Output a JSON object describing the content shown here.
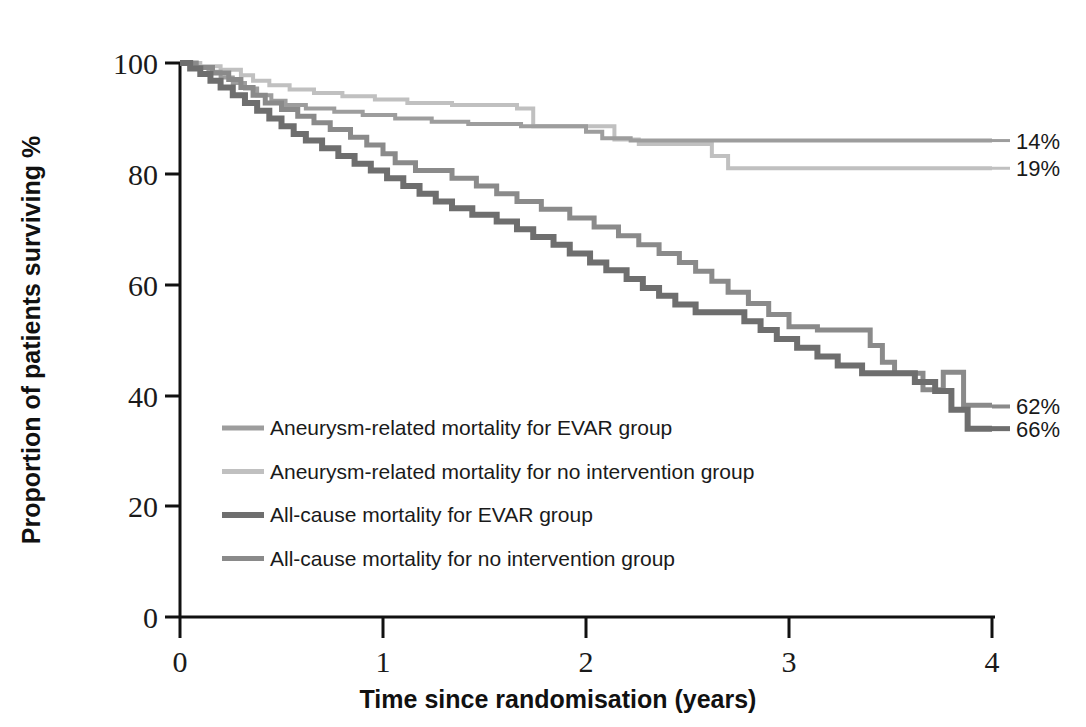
{
  "chart_data": {
    "type": "line",
    "title": "",
    "xlabel": "Time since randomisation (years)",
    "ylabel": "Proportion of patients surviving %",
    "xlim": [
      0,
      4
    ],
    "ylim": [
      0,
      100
    ],
    "xticks": [
      "0",
      "1",
      "2",
      "3",
      "4"
    ],
    "yticks": [
      "0",
      "20",
      "40",
      "60",
      "80",
      "100"
    ],
    "grid": false,
    "legend_position": "inside-lower-left",
    "series": [
      {
        "name": "Aneurysm-related mortality for EVAR group",
        "color": "#9d9d9d",
        "width": 4,
        "endpoint_label": "14%",
        "endpoint_value": 86,
        "points": [
          [
            0.0,
            100
          ],
          [
            0.07,
            100
          ],
          [
            0.07,
            99.2
          ],
          [
            0.14,
            99.2
          ],
          [
            0.14,
            98.4
          ],
          [
            0.2,
            98.4
          ],
          [
            0.2,
            97.4
          ],
          [
            0.26,
            97.4
          ],
          [
            0.26,
            96.4
          ],
          [
            0.32,
            96.4
          ],
          [
            0.32,
            95.4
          ],
          [
            0.38,
            95.4
          ],
          [
            0.38,
            94.2
          ],
          [
            0.45,
            94.2
          ],
          [
            0.45,
            93.2
          ],
          [
            0.52,
            93.2
          ],
          [
            0.52,
            92.4
          ],
          [
            0.62,
            92.4
          ],
          [
            0.62,
            91.8
          ],
          [
            0.76,
            91.8
          ],
          [
            0.76,
            91.2
          ],
          [
            0.9,
            91.2
          ],
          [
            0.9,
            90.6
          ],
          [
            1.06,
            90.6
          ],
          [
            1.06,
            90.0
          ],
          [
            1.24,
            90.0
          ],
          [
            1.24,
            89.4
          ],
          [
            1.42,
            89.4
          ],
          [
            1.42,
            89.0
          ],
          [
            1.68,
            89.0
          ],
          [
            1.68,
            88.6
          ],
          [
            2.0,
            88.6
          ],
          [
            2.0,
            87.6
          ],
          [
            2.08,
            87.6
          ],
          [
            2.08,
            86.4
          ],
          [
            2.22,
            86.4
          ],
          [
            2.22,
            86.0
          ],
          [
            4.0,
            86.0
          ]
        ]
      },
      {
        "name": "Aneurysm-related mortality for no intervention group",
        "color": "#c0c0c0",
        "width": 4,
        "endpoint_label": "19%",
        "endpoint_value": 81,
        "points": [
          [
            0.0,
            100
          ],
          [
            0.1,
            100
          ],
          [
            0.1,
            99.4
          ],
          [
            0.2,
            99.4
          ],
          [
            0.2,
            98.8
          ],
          [
            0.3,
            98.8
          ],
          [
            0.3,
            97.8
          ],
          [
            0.36,
            97.8
          ],
          [
            0.36,
            96.8
          ],
          [
            0.44,
            96.8
          ],
          [
            0.44,
            96.0
          ],
          [
            0.54,
            96.0
          ],
          [
            0.54,
            95.2
          ],
          [
            0.66,
            95.2
          ],
          [
            0.66,
            94.6
          ],
          [
            0.8,
            94.6
          ],
          [
            0.8,
            94.0
          ],
          [
            0.96,
            94.0
          ],
          [
            0.96,
            93.4
          ],
          [
            1.12,
            93.4
          ],
          [
            1.12,
            92.8
          ],
          [
            1.34,
            92.8
          ],
          [
            1.34,
            92.4
          ],
          [
            1.66,
            92.4
          ],
          [
            1.66,
            91.8
          ],
          [
            1.74,
            91.8
          ],
          [
            1.74,
            88.6
          ],
          [
            2.14,
            88.6
          ],
          [
            2.14,
            86.2
          ],
          [
            2.26,
            86.2
          ],
          [
            2.26,
            85.4
          ],
          [
            2.62,
            85.4
          ],
          [
            2.62,
            83.2
          ],
          [
            2.7,
            83.2
          ],
          [
            2.7,
            81.0
          ],
          [
            4.0,
            81.0
          ]
        ]
      },
      {
        "name": "All-cause mortality for EVAR group",
        "color": "#6e6e6e",
        "width": 6,
        "endpoint_label": "66%",
        "endpoint_value": 34,
        "points": [
          [
            0.0,
            100
          ],
          [
            0.05,
            100
          ],
          [
            0.05,
            99.0
          ],
          [
            0.1,
            99.0
          ],
          [
            0.1,
            98.0
          ],
          [
            0.15,
            98.0
          ],
          [
            0.15,
            96.8
          ],
          [
            0.2,
            96.8
          ],
          [
            0.2,
            95.6
          ],
          [
            0.26,
            95.6
          ],
          [
            0.26,
            94.2
          ],
          [
            0.32,
            94.2
          ],
          [
            0.32,
            92.8
          ],
          [
            0.38,
            92.8
          ],
          [
            0.38,
            91.4
          ],
          [
            0.44,
            91.4
          ],
          [
            0.44,
            90.0
          ],
          [
            0.5,
            90.0
          ],
          [
            0.5,
            88.6
          ],
          [
            0.56,
            88.6
          ],
          [
            0.56,
            87.2
          ],
          [
            0.62,
            87.2
          ],
          [
            0.62,
            86.0
          ],
          [
            0.7,
            86.0
          ],
          [
            0.7,
            84.6
          ],
          [
            0.78,
            84.6
          ],
          [
            0.78,
            83.2
          ],
          [
            0.86,
            83.2
          ],
          [
            0.86,
            81.8
          ],
          [
            0.94,
            81.8
          ],
          [
            0.94,
            80.6
          ],
          [
            1.02,
            80.6
          ],
          [
            1.02,
            79.2
          ],
          [
            1.1,
            79.2
          ],
          [
            1.1,
            77.8
          ],
          [
            1.18,
            77.8
          ],
          [
            1.18,
            76.4
          ],
          [
            1.26,
            76.4
          ],
          [
            1.26,
            75.0
          ],
          [
            1.34,
            75.0
          ],
          [
            1.34,
            73.8
          ],
          [
            1.44,
            73.8
          ],
          [
            1.44,
            72.6
          ],
          [
            1.56,
            72.6
          ],
          [
            1.56,
            71.4
          ],
          [
            1.66,
            71.4
          ],
          [
            1.66,
            70.0
          ],
          [
            1.74,
            70.0
          ],
          [
            1.74,
            68.6
          ],
          [
            1.84,
            68.6
          ],
          [
            1.84,
            67.2
          ],
          [
            1.92,
            67.2
          ],
          [
            1.92,
            65.6
          ],
          [
            2.02,
            65.6
          ],
          [
            2.02,
            64.0
          ],
          [
            2.1,
            64.0
          ],
          [
            2.1,
            62.6
          ],
          [
            2.2,
            62.6
          ],
          [
            2.2,
            61.0
          ],
          [
            2.28,
            61.0
          ],
          [
            2.28,
            59.4
          ],
          [
            2.36,
            59.4
          ],
          [
            2.36,
            58.0
          ],
          [
            2.44,
            58.0
          ],
          [
            2.44,
            56.4
          ],
          [
            2.54,
            56.4
          ],
          [
            2.54,
            55.0
          ],
          [
            2.78,
            55.0
          ],
          [
            2.78,
            53.4
          ],
          [
            2.86,
            53.4
          ],
          [
            2.86,
            51.8
          ],
          [
            2.94,
            51.8
          ],
          [
            2.94,
            50.2
          ],
          [
            3.04,
            50.2
          ],
          [
            3.04,
            48.6
          ],
          [
            3.14,
            48.6
          ],
          [
            3.14,
            47.0
          ],
          [
            3.24,
            47.0
          ],
          [
            3.24,
            45.4
          ],
          [
            3.36,
            45.4
          ],
          [
            3.36,
            44.0
          ],
          [
            3.62,
            44.0
          ],
          [
            3.62,
            42.4
          ],
          [
            3.72,
            42.4
          ],
          [
            3.72,
            40.8
          ],
          [
            3.8,
            40.8
          ],
          [
            3.8,
            37.4
          ],
          [
            3.88,
            37.4
          ],
          [
            3.88,
            34.0
          ],
          [
            4.0,
            34.0
          ]
        ]
      },
      {
        "name": "All-cause mortality for no intervention group",
        "color": "#8a8a8a",
        "width": 5,
        "endpoint_label": "62%",
        "endpoint_value": 38,
        "points": [
          [
            0.0,
            100
          ],
          [
            0.08,
            100
          ],
          [
            0.08,
            99.2
          ],
          [
            0.16,
            99.2
          ],
          [
            0.16,
            98.2
          ],
          [
            0.24,
            98.2
          ],
          [
            0.24,
            97.0
          ],
          [
            0.3,
            97.0
          ],
          [
            0.3,
            95.6
          ],
          [
            0.36,
            95.6
          ],
          [
            0.36,
            94.2
          ],
          [
            0.42,
            94.2
          ],
          [
            0.42,
            92.8
          ],
          [
            0.5,
            92.8
          ],
          [
            0.5,
            91.6
          ],
          [
            0.58,
            91.6
          ],
          [
            0.58,
            90.4
          ],
          [
            0.66,
            90.4
          ],
          [
            0.66,
            89.2
          ],
          [
            0.74,
            89.2
          ],
          [
            0.74,
            88.0
          ],
          [
            0.84,
            88.0
          ],
          [
            0.84,
            86.6
          ],
          [
            0.92,
            86.6
          ],
          [
            0.92,
            85.2
          ],
          [
            1.0,
            85.2
          ],
          [
            1.0,
            83.6
          ],
          [
            1.06,
            83.6
          ],
          [
            1.06,
            82.0
          ],
          [
            1.16,
            82.0
          ],
          [
            1.16,
            80.6
          ],
          [
            1.34,
            80.6
          ],
          [
            1.34,
            79.2
          ],
          [
            1.46,
            79.2
          ],
          [
            1.46,
            77.8
          ],
          [
            1.56,
            77.8
          ],
          [
            1.56,
            76.4
          ],
          [
            1.66,
            76.4
          ],
          [
            1.66,
            75.0
          ],
          [
            1.78,
            75.0
          ],
          [
            1.78,
            73.6
          ],
          [
            1.92,
            73.6
          ],
          [
            1.92,
            72.0
          ],
          [
            2.04,
            72.0
          ],
          [
            2.04,
            70.4
          ],
          [
            2.16,
            70.4
          ],
          [
            2.16,
            68.8
          ],
          [
            2.26,
            68.8
          ],
          [
            2.26,
            67.2
          ],
          [
            2.36,
            67.2
          ],
          [
            2.36,
            65.6
          ],
          [
            2.46,
            65.6
          ],
          [
            2.46,
            64.0
          ],
          [
            2.54,
            64.0
          ],
          [
            2.54,
            62.4
          ],
          [
            2.62,
            62.4
          ],
          [
            2.62,
            60.6
          ],
          [
            2.7,
            60.6
          ],
          [
            2.7,
            58.6
          ],
          [
            2.8,
            58.6
          ],
          [
            2.8,
            56.6
          ],
          [
            2.9,
            56.6
          ],
          [
            2.9,
            54.6
          ],
          [
            3.0,
            54.6
          ],
          [
            3.0,
            52.4
          ],
          [
            3.14,
            52.4
          ],
          [
            3.14,
            51.8
          ],
          [
            3.4,
            51.8
          ],
          [
            3.4,
            49.0
          ],
          [
            3.46,
            49.0
          ],
          [
            3.46,
            46.0
          ],
          [
            3.52,
            46.0
          ],
          [
            3.52,
            44.0
          ],
          [
            3.66,
            44.0
          ],
          [
            3.66,
            41.0
          ],
          [
            3.76,
            41.0
          ],
          [
            3.76,
            44.2
          ],
          [
            3.86,
            44.2
          ],
          [
            3.86,
            38.2
          ],
          [
            4.0,
            38.2
          ]
        ]
      }
    ],
    "endpoint_annotations": [
      {
        "label": "14%",
        "y": 86
      },
      {
        "label": "19%",
        "y": 81
      },
      {
        "label": "62%",
        "y": 38
      },
      {
        "label": "66%",
        "y": 34
      }
    ]
  },
  "legend": {
    "items": [
      {
        "label": "Aneurysm-related mortality for EVAR group"
      },
      {
        "label": "Aneurysm-related mortality for no intervention group"
      },
      {
        "label": "All-cause mortality for EVAR group"
      },
      {
        "label": "All-cause mortality for no intervention group"
      }
    ]
  },
  "axes": {
    "y_title": "Proportion of patients surviving %",
    "x_title": "Time since randomisation (years)",
    "y_tick_labels": [
      "100",
      "80",
      "60",
      "40",
      "20",
      "0"
    ],
    "x_tick_labels": [
      "0",
      "1",
      "2",
      "3",
      "4"
    ]
  }
}
